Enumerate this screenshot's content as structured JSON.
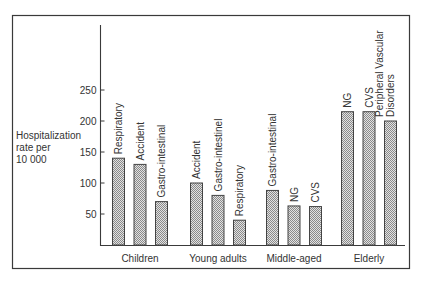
{
  "chart_data": {
    "type": "bar",
    "title": "",
    "xlabel": "",
    "ylabel": "Hospitalization rate per 10 000",
    "ylabel_lines": [
      "Hospitalization",
      "rate per",
      "10 000"
    ],
    "ylim": [
      0,
      280
    ],
    "yticks": [
      50,
      100,
      150,
      200,
      250
    ],
    "grid": false,
    "legend": null,
    "categories": [
      "Children",
      "Young adults",
      "Middle-aged",
      "Elderly"
    ],
    "groups": [
      {
        "category": "Children",
        "bars": [
          {
            "label": "Respiratory",
            "value": 140
          },
          {
            "label": "Accident",
            "value": 130
          },
          {
            "label": "Gastro-intestinal",
            "value": 70
          }
        ]
      },
      {
        "category": "Young adults",
        "bars": [
          {
            "label": "Accident",
            "value": 100
          },
          {
            "label": "Gastro-intestinel",
            "value": 80
          },
          {
            "label": "Respiratory",
            "value": 40
          }
        ]
      },
      {
        "category": "Middle-aged",
        "bars": [
          {
            "label": "Gastro-intestinal",
            "value": 88
          },
          {
            "label": "NG",
            "value": 63
          },
          {
            "label": "CVS",
            "value": 62
          }
        ]
      },
      {
        "category": "Elderly",
        "bars": [
          {
            "label": "NG",
            "value": 215
          },
          {
            "label": "CVS",
            "value": 215
          },
          {
            "label": "Peripheral Vascular Disorders",
            "value": 200,
            "label_lines": [
              "Peripheral Vascular",
              "Disorders"
            ]
          }
        ]
      }
    ]
  },
  "colors": {
    "frame": "#3a3a3a",
    "axis": "#3a3a3a",
    "bar_fill": "#bdbdbd",
    "bar_stroke": "#444444",
    "text": "#333333"
  }
}
